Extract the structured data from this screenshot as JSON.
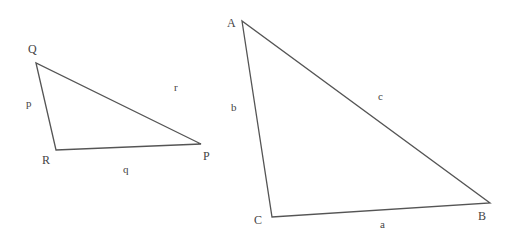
{
  "colors": {
    "background": "#ffffff",
    "line": "#555555",
    "text": "#444444"
  },
  "triangles": [
    {
      "name": "PQR",
      "vertices": [
        {
          "label": "Q",
          "x": 36,
          "y": 63,
          "lx": 28,
          "ly": 53
        },
        {
          "label": "R",
          "x": 56,
          "y": 150,
          "lx": 42,
          "ly": 164
        },
        {
          "label": "P",
          "x": 201,
          "y": 144,
          "lx": 203,
          "ly": 160
        }
      ],
      "sides": [
        {
          "label": "p",
          "lx": 26,
          "ly": 107
        },
        {
          "label": "q",
          "lx": 123,
          "ly": 173
        },
        {
          "label": "r",
          "lx": 174,
          "ly": 91
        }
      ]
    },
    {
      "name": "ABC",
      "vertices": [
        {
          "label": "A",
          "x": 242,
          "y": 21,
          "lx": 227,
          "ly": 27
        },
        {
          "label": "C",
          "x": 272,
          "y": 217,
          "lx": 254,
          "ly": 224
        },
        {
          "label": "B",
          "x": 490,
          "y": 203,
          "lx": 478,
          "ly": 220
        }
      ],
      "sides": [
        {
          "label": "b",
          "lx": 231,
          "ly": 111
        },
        {
          "label": "c",
          "lx": 378,
          "ly": 100
        },
        {
          "label": "a",
          "lx": 380,
          "ly": 228
        }
      ]
    }
  ]
}
